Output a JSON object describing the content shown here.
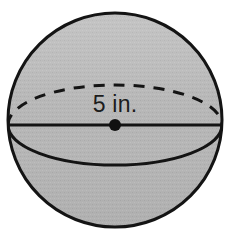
{
  "figure": {
    "name": "sphere-diagram",
    "background_color": "#ffffff"
  },
  "sphere": {
    "label": "sphere-body",
    "fill_color": "#b9b9b9",
    "outline_color": "#141414",
    "outline_width": 3,
    "center_x": 115,
    "center_y": 120,
    "radius": 107,
    "texture": "halftone-dither"
  },
  "equator": {
    "label": "equator-ellipse",
    "back_half_style": "dashed",
    "front_half_style": "solid",
    "stroke_color": "#141414",
    "stroke_width": 3,
    "dash_pattern": "11 9",
    "semi_minor_axis": 40
  },
  "diameter": {
    "label": "diameter-line",
    "style": "solid",
    "stroke_color": "#141414",
    "stroke_width": 3,
    "y": 125
  },
  "center_point": {
    "label": "center-dot",
    "fill_color": "#111111",
    "radius": 6,
    "x": 115,
    "y": 125
  },
  "dimension_label": {
    "name": "diameter-measure",
    "text": "5 in.",
    "value": "5",
    "unit": "in.",
    "color": "#1c1c1c",
    "x": 115,
    "y": 112
  }
}
